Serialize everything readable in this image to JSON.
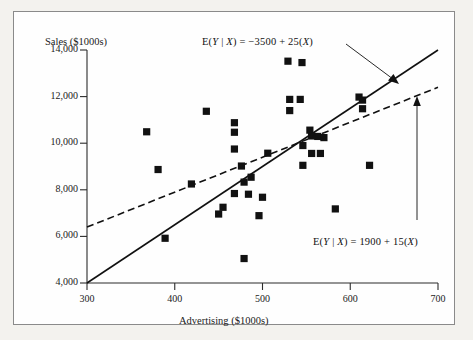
{
  "figure": {
    "frame_color": "#8a8a8a",
    "background": "#fefefe"
  },
  "chart_data": {
    "type": "scatter",
    "title": "",
    "xlabel": "Advertising ($1000s)",
    "ylabel": "Sales ($1000s)",
    "xlim": [
      300,
      700
    ],
    "ylim": [
      4000,
      14000
    ],
    "xticks": [
      300,
      400,
      500,
      600,
      700
    ],
    "xtick_labels": [
      "300",
      "400",
      "500",
      "600",
      "700"
    ],
    "yticks": [
      4000,
      6000,
      8000,
      10000,
      12000,
      14000
    ],
    "ytick_labels": [
      "4,000",
      "6,000",
      "8,000",
      "10,000",
      "12,000",
      "14,000"
    ],
    "grid": false,
    "legend": "none",
    "marker": "square",
    "marker_color": "#111111",
    "points": [
      {
        "x": 368,
        "y": 10490
      },
      {
        "x": 381,
        "y": 8870
      },
      {
        "x": 389,
        "y": 5920
      },
      {
        "x": 419,
        "y": 8250
      },
      {
        "x": 436,
        "y": 11370
      },
      {
        "x": 450,
        "y": 6960
      },
      {
        "x": 455,
        "y": 7250
      },
      {
        "x": 468,
        "y": 10880
      },
      {
        "x": 468,
        "y": 10470
      },
      {
        "x": 468,
        "y": 9750
      },
      {
        "x": 468,
        "y": 7840
      },
      {
        "x": 476,
        "y": 9020
      },
      {
        "x": 479,
        "y": 8330
      },
      {
        "x": 479,
        "y": 5050
      },
      {
        "x": 484,
        "y": 7810
      },
      {
        "x": 487,
        "y": 8540
      },
      {
        "x": 496,
        "y": 6890
      },
      {
        "x": 500,
        "y": 7680
      },
      {
        "x": 506,
        "y": 9570
      },
      {
        "x": 529,
        "y": 13520
      },
      {
        "x": 531,
        "y": 11880
      },
      {
        "x": 531,
        "y": 11400
      },
      {
        "x": 543,
        "y": 11880
      },
      {
        "x": 545,
        "y": 13460
      },
      {
        "x": 546,
        "y": 9900
      },
      {
        "x": 546,
        "y": 9050
      },
      {
        "x": 554,
        "y": 10560
      },
      {
        "x": 556,
        "y": 10310
      },
      {
        "x": 556,
        "y": 9560
      },
      {
        "x": 563,
        "y": 10290
      },
      {
        "x": 566,
        "y": 9560
      },
      {
        "x": 570,
        "y": 10240
      },
      {
        "x": 583,
        "y": 7180
      },
      {
        "x": 610,
        "y": 11980
      },
      {
        "x": 614,
        "y": 11850
      },
      {
        "x": 614,
        "y": 11480
      },
      {
        "x": 622,
        "y": 9050
      }
    ],
    "lines": [
      {
        "name": "steep-regression-line",
        "style": "solid",
        "intercept": -3500,
        "slope": 25,
        "label": "E(Y | X) = −3500 + 25(X)",
        "x_start": 300,
        "x_end": 700
      },
      {
        "name": "shallow-regression-line",
        "style": "dashed",
        "intercept": 1900,
        "slope": 15,
        "label": "E(Y | X) = 1900 + 15(X)",
        "x_start": 300,
        "x_end": 700
      }
    ],
    "annotations": [
      {
        "name": "steep-line-equation",
        "text_parts": {
          "lead": "E(",
          "var_y": "Y",
          "bar": " | ",
          "var_x": "X",
          "mid": ") = −3500 + 25(",
          "var_x2": "X",
          "tail": ")"
        },
        "full_text": "E(Y | X) = −3500 + 25(X)",
        "arrow": {
          "from_x": 334,
          "from_y": 42,
          "to_x": 388,
          "to_y": 81
        }
      },
      {
        "name": "shallow-line-equation",
        "text_parts": {
          "lead": "E(",
          "var_y": "Y",
          "bar": " | ",
          "var_x": "X",
          "mid": ") = 1900 + 15(",
          "var_x2": "X",
          "tail": ")"
        },
        "full_text": "E(Y | X) = 1900 + 15(X)",
        "arrow": {
          "from_x": 415,
          "from_y": 218,
          "to_x": 415,
          "to_y": 98
        }
      }
    ]
  }
}
